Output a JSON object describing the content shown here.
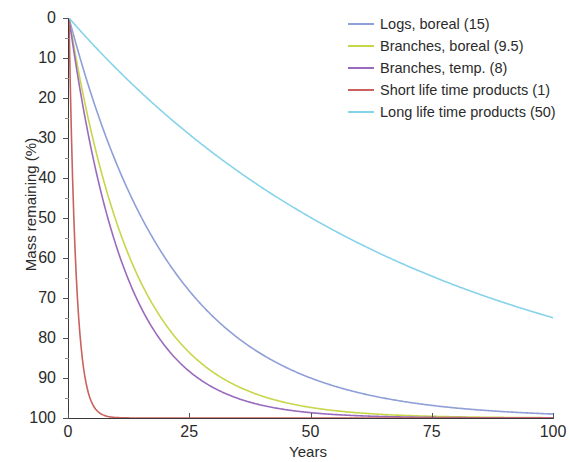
{
  "chart_data": {
    "type": "line",
    "title": "",
    "xlabel": "Years",
    "ylabel": "Mass remaining (%)",
    "xlim": [
      0,
      100
    ],
    "ylim": [
      0,
      100
    ],
    "xticks": [
      0,
      25,
      50,
      75,
      100
    ],
    "yticks": [
      0,
      10,
      20,
      30,
      40,
      50,
      60,
      70,
      80,
      90,
      100
    ],
    "grid": false,
    "legend_position": "top-right",
    "decay_model": "exponential half-life: y = 100 * 0.5^(t/T)",
    "series": [
      {
        "name": "Logs, boreal (15)",
        "half_life": 15,
        "color": "#8f9fd8",
        "x": [
          0,
          5,
          10,
          15,
          20,
          25,
          30,
          35,
          40,
          45,
          50,
          55,
          60,
          65,
          70,
          75,
          80,
          85,
          90,
          95,
          100
        ],
        "values": [
          100,
          79.4,
          63.0,
          50.0,
          39.7,
          31.5,
          25.0,
          19.8,
          15.7,
          12.5,
          9.9,
          7.9,
          6.3,
          5.0,
          3.9,
          3.1,
          2.5,
          2.0,
          1.6,
          1.2,
          1.0
        ]
      },
      {
        "name": "Branches, boreal (9.5)",
        "half_life": 9.5,
        "color": "#c8d64a",
        "x": [
          0,
          5,
          10,
          15,
          20,
          25,
          30,
          35,
          40,
          45,
          50,
          55,
          60,
          65,
          70,
          75,
          80,
          85,
          90,
          95,
          100
        ],
        "values": [
          100,
          69.4,
          48.2,
          33.4,
          23.2,
          16.1,
          11.2,
          7.8,
          5.4,
          3.7,
          2.6,
          1.8,
          1.25,
          0.87,
          0.6,
          0.42,
          0.29,
          0.2,
          0.14,
          0.1,
          0.07
        ]
      },
      {
        "name": "Branches, temp. (8)",
        "half_life": 8,
        "color": "#9a6bbd",
        "x": [
          0,
          5,
          10,
          15,
          20,
          25,
          30,
          35,
          40,
          45,
          50,
          55,
          60,
          65,
          70,
          75,
          80,
          85,
          90,
          95,
          100
        ],
        "values": [
          100,
          64.8,
          42.0,
          27.2,
          17.7,
          11.4,
          7.4,
          4.8,
          3.1,
          2.0,
          1.3,
          0.85,
          0.55,
          0.36,
          0.23,
          0.15,
          0.1,
          0.06,
          0.04,
          0.03,
          0.02
        ]
      },
      {
        "name": "Short life time products (1)",
        "half_life": 1,
        "color": "#c9625e",
        "x": [
          0,
          1,
          2,
          3,
          4,
          5,
          6,
          7,
          8,
          9,
          10,
          15,
          20,
          30,
          50,
          75,
          100
        ],
        "values": [
          100,
          50,
          25,
          12.5,
          6.25,
          3.13,
          1.56,
          0.78,
          0.39,
          0.2,
          0.1,
          0.003,
          0.0001,
          0,
          0,
          0,
          0
        ]
      },
      {
        "name": "Long life time products (50)",
        "half_life": 50,
        "color": "#87d3ea",
        "x": [
          0,
          5,
          10,
          15,
          20,
          25,
          30,
          35,
          40,
          45,
          50,
          55,
          60,
          65,
          70,
          75,
          80,
          85,
          90,
          95,
          100
        ],
        "values": [
          100,
          93.3,
          87.1,
          81.2,
          75.8,
          70.7,
          66.0,
          61.6,
          57.4,
          53.6,
          50.0,
          46.6,
          43.5,
          40.6,
          37.9,
          35.4,
          33.0,
          30.8,
          28.7,
          26.8,
          25.0
        ]
      }
    ]
  },
  "axes": {
    "y_tick_labels": [
      "100",
      "90",
      "80",
      "70",
      "60",
      "50",
      "40",
      "30",
      "20",
      "10",
      "0"
    ],
    "x_tick_labels": [
      "0",
      "25",
      "50",
      "75",
      "100"
    ],
    "y_title": "Mass remaining (%)",
    "x_title": "Years"
  },
  "legend": {
    "items": [
      {
        "label": "Logs, boreal (15)",
        "color": "#8f9fd8"
      },
      {
        "label": "Branches, boreal (9.5)",
        "color": "#c8d64a"
      },
      {
        "label": "Branches, temp. (8)",
        "color": "#9a6bbd"
      },
      {
        "label": "Short life time products (1)",
        "color": "#c9625e"
      },
      {
        "label": "Long life time products (50)",
        "color": "#87d3ea"
      }
    ]
  }
}
